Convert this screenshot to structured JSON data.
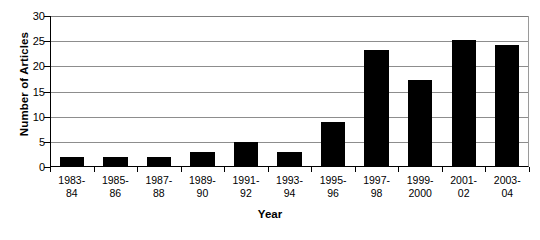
{
  "chart_data": {
    "type": "bar",
    "title": "",
    "xlabel": "Year",
    "ylabel": "Number of Articles",
    "categories": [
      "1983-84",
      "1985-86",
      "1987-88",
      "1989-90",
      "1991-92",
      "1993-94",
      "1995-96",
      "1997-98",
      "1999-2000",
      "2001-02",
      "2003-04"
    ],
    "category_lines": [
      [
        "1983-",
        "84"
      ],
      [
        "1985-",
        "86"
      ],
      [
        "1987-",
        "88"
      ],
      [
        "1989-",
        "90"
      ],
      [
        "1991-",
        "92"
      ],
      [
        "1993-",
        "94"
      ],
      [
        "1995-",
        "96"
      ],
      [
        "1997-",
        "98"
      ],
      [
        "1999-",
        "2000"
      ],
      [
        "2001-",
        "02"
      ],
      [
        "2003-",
        "04"
      ]
    ],
    "values": [
      2,
      2,
      2,
      3,
      5,
      3,
      9,
      23.3,
      17.3,
      25.2,
      24.2
    ],
    "ylim": [
      0,
      30
    ],
    "ytick_labels": [
      "30",
      "25",
      "20",
      "15",
      "10",
      "5",
      "0"
    ],
    "ytick_values": [
      30,
      25,
      20,
      15,
      10,
      5,
      0
    ],
    "grid": true,
    "legend": false,
    "bar_color": "#000000",
    "grid_color": "#8d8d8d",
    "axis_color": "#000000",
    "background_color": "#ffffff"
  }
}
